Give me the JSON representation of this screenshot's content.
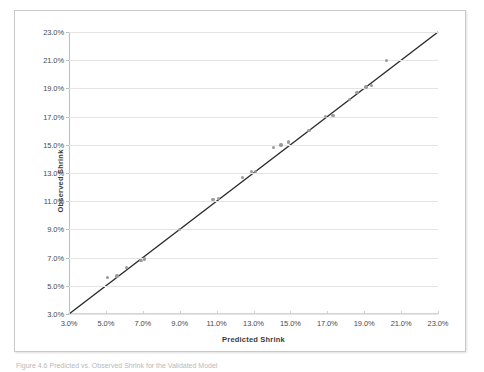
{
  "figure": {
    "caption": "Figure 4.6  Predicted vs. Observed Shrink for the Validated Model"
  },
  "chart_data": {
    "type": "scatter",
    "title": "",
    "xlabel": "Predicted Shrink",
    "ylabel": "Observed Shrink",
    "xlim": [
      3.0,
      23.0
    ],
    "ylim": [
      3.0,
      23.0
    ],
    "xtick_step": 2.0,
    "ytick_step": 2.0,
    "grid": "horizontal",
    "legend": "none",
    "value_suffix": "%",
    "xticks": [
      "3.0%",
      "5.0%",
      "7.0%",
      "9.0%",
      "11.0%",
      "13.0%",
      "15.0%",
      "17.0%",
      "19.0%",
      "21.0%",
      "23.0%"
    ],
    "yticks": [
      "3.0%",
      "5.0%",
      "7.0%",
      "9.0%",
      "11.0%",
      "13.0%",
      "15.0%",
      "17.0%",
      "19.0%",
      "21.0%",
      "23.0%"
    ],
    "xtick_values": [
      3.0,
      5.0,
      7.0,
      9.0,
      11.0,
      13.0,
      15.0,
      17.0,
      19.0,
      21.0,
      23.0
    ],
    "ytick_values": [
      3.0,
      5.0,
      7.0,
      9.0,
      11.0,
      13.0,
      15.0,
      17.0,
      19.0,
      21.0,
      23.0
    ],
    "reference_line": {
      "name": "identity-line",
      "type": "linear",
      "slope": 1.0,
      "intercept": 0.0,
      "from": [
        3.0,
        3.0
      ],
      "to": [
        23.0,
        23.0
      ],
      "color": "#2b2b2b"
    },
    "series": [
      {
        "name": "Observed vs Predicted Shrink",
        "marker": "circle",
        "color": "#9a9a9a",
        "points": [
          {
            "x": 5.1,
            "y": 5.6
          },
          {
            "x": 5.6,
            "y": 5.7
          },
          {
            "x": 6.1,
            "y": 6.3
          },
          {
            "x": 6.9,
            "y": 6.8
          },
          {
            "x": 7.1,
            "y": 6.9
          },
          {
            "x": 9.0,
            "y": 9.0
          },
          {
            "x": 10.8,
            "y": 11.1
          },
          {
            "x": 11.1,
            "y": 11.2
          },
          {
            "x": 12.4,
            "y": 12.7
          },
          {
            "x": 12.9,
            "y": 13.1
          },
          {
            "x": 13.1,
            "y": 13.1
          },
          {
            "x": 14.1,
            "y": 14.8
          },
          {
            "x": 14.5,
            "y": 15.0
          },
          {
            "x": 14.9,
            "y": 15.2
          },
          {
            "x": 16.0,
            "y": 16.0
          },
          {
            "x": 16.9,
            "y": 17.0
          },
          {
            "x": 17.3,
            "y": 17.1
          },
          {
            "x": 18.2,
            "y": 18.2
          },
          {
            "x": 18.6,
            "y": 18.7
          },
          {
            "x": 19.1,
            "y": 19.1
          },
          {
            "x": 19.4,
            "y": 19.2
          },
          {
            "x": 20.2,
            "y": 21.0
          }
        ]
      }
    ]
  }
}
